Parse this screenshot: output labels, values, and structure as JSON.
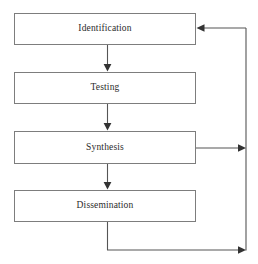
{
  "diagram": {
    "type": "flowchart",
    "canvas": {
      "width": 258,
      "height": 264,
      "background": "#ffffff"
    },
    "style": {
      "box_stroke": "#7d7d7d",
      "box_fill": "#ffffff",
      "connector_stroke": "#555555",
      "text_color": "#2b2b2b"
    },
    "nodes": [
      {
        "id": "identification",
        "label": "Identification",
        "x": 14,
        "y": 13,
        "width": 182,
        "height": 32
      },
      {
        "id": "testing",
        "label": "Testing",
        "x": 14,
        "y": 72,
        "width": 182,
        "height": 32
      },
      {
        "id": "synthesis",
        "label": "Synthesis",
        "x": 14,
        "y": 131,
        "width": 182,
        "height": 33
      },
      {
        "id": "dissemination",
        "label": "Dissemination",
        "x": 14,
        "y": 190,
        "width": 182,
        "height": 32
      }
    ],
    "connectors": [
      {
        "id": "identification-to-testing",
        "from": "identification",
        "to": "testing",
        "direction": "down",
        "arrowhead": "end"
      },
      {
        "id": "testing-to-synthesis",
        "from": "testing",
        "to": "synthesis",
        "direction": "down",
        "arrowhead": "end"
      },
      {
        "id": "synthesis-to-dissemination",
        "from": "synthesis",
        "to": "dissemination",
        "direction": "down",
        "arrowhead": "end"
      },
      {
        "id": "synthesis-to-feedback-bus",
        "from": "synthesis",
        "to": "feedback-bus",
        "direction": "right",
        "arrowhead": "end"
      },
      {
        "id": "dissemination-to-feedback-bus",
        "from": "dissemination",
        "to": "feedback-bus",
        "direction": "down-right",
        "arrowhead": "end"
      },
      {
        "id": "feedback-bus-to-identification",
        "from": "feedback-bus",
        "to": "identification",
        "direction": "left",
        "arrowhead": "end"
      }
    ],
    "feedback_bus": {
      "id": "feedback-bus",
      "x": 246,
      "y_top": 28,
      "y_bottom": 250
    }
  }
}
